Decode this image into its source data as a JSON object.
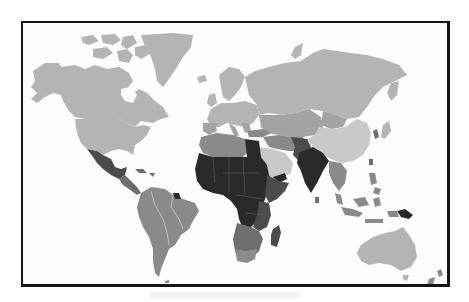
{
  "figure": {
    "type": "choropleth-world-map",
    "colormap": "grayscale",
    "frame_color": "#151515",
    "background": "#fdfdfd"
  },
  "shades": {
    "lightest": "#c9c9c9",
    "light": "#b4b4b4",
    "medium_light": "#a3a3a3",
    "medium": "#8a8a8a",
    "medium_dark": "#6e6e6e",
    "dark": "#4c4c4c",
    "darkest": "#2a2a2a"
  },
  "regions": [
    {
      "name": "Canada",
      "shade": "light"
    },
    {
      "name": "Alaska",
      "shade": "light"
    },
    {
      "name": "Greenland",
      "shade": "light"
    },
    {
      "name": "United States",
      "shade": "light"
    },
    {
      "name": "Mexico",
      "shade": "dark"
    },
    {
      "name": "Central America",
      "shade": "medium_dark"
    },
    {
      "name": "South America",
      "shade": "medium"
    },
    {
      "name": "Europe",
      "shade": "light"
    },
    {
      "name": "Russia",
      "shade": "light"
    },
    {
      "name": "Central Asia",
      "shade": "medium_light"
    },
    {
      "name": "China",
      "shade": "lightest"
    },
    {
      "name": "Middle East",
      "shade": "medium"
    },
    {
      "name": "Arabian Peninsula",
      "shade": "lightest"
    },
    {
      "name": "North Africa",
      "shade": "medium"
    },
    {
      "name": "Egypt",
      "shade": "darkest"
    },
    {
      "name": "Sub-Saharan Africa",
      "shade": "darkest"
    },
    {
      "name": "East Africa",
      "shade": "dark"
    },
    {
      "name": "Southern Africa",
      "shade": "medium_dark"
    },
    {
      "name": "Madagascar",
      "shade": "dark"
    },
    {
      "name": "India",
      "shade": "darkest"
    },
    {
      "name": "Southeast Asia",
      "shade": "medium"
    },
    {
      "name": "Papua New Guinea",
      "shade": "darkest"
    },
    {
      "name": "Australia",
      "shade": "light"
    },
    {
      "name": "New Zealand",
      "shade": "medium"
    }
  ]
}
